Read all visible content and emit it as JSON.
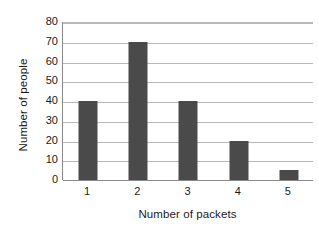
{
  "chart_data": {
    "type": "bar",
    "title": "",
    "xlabel": "Number of packets",
    "ylabel": "Number of people",
    "categories": [
      "1",
      "2",
      "3",
      "4",
      "5"
    ],
    "values": [
      40,
      70,
      40,
      20,
      5
    ],
    "series": [
      {
        "name": "Number of people",
        "values": [
          40,
          70,
          40,
          20,
          5
        ]
      }
    ],
    "ylim": [
      0,
      80
    ],
    "yticks": [
      0,
      10,
      20,
      30,
      40,
      50,
      60,
      70,
      80
    ],
    "ytick_labels": [
      "0",
      "10",
      "20",
      "30",
      "40",
      "50",
      "60",
      "70",
      "80"
    ],
    "grid": true,
    "grid_axis": "y",
    "legend": false,
    "legend_position": "none",
    "bar_color": "#4a4a4a",
    "gridline_color": "#b9b9b9",
    "axis_color": "#8a8a8a",
    "background_color": "#ffffff"
  }
}
